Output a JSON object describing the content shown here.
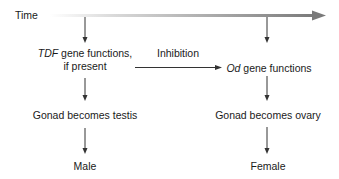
{
  "diagram": {
    "time_axis": {
      "label": "Time",
      "gradient_start": "#ffffff",
      "gradient_end": "#7a7a7a"
    },
    "left_branch": {
      "gene_label_italic": "TDF",
      "gene_label_rest": " gene functions,",
      "gene_label_line2": "if present",
      "gonad": "Gonad becomes testis",
      "outcome": "Male"
    },
    "right_branch": {
      "gene_label_italic": "Od",
      "gene_label_rest": " gene functions",
      "gonad": "Gonad becomes ovary",
      "outcome": "Female"
    },
    "inhibition": {
      "label": "Inhibition"
    },
    "colors": {
      "line": "#333333",
      "text": "#1a1a1a"
    }
  }
}
